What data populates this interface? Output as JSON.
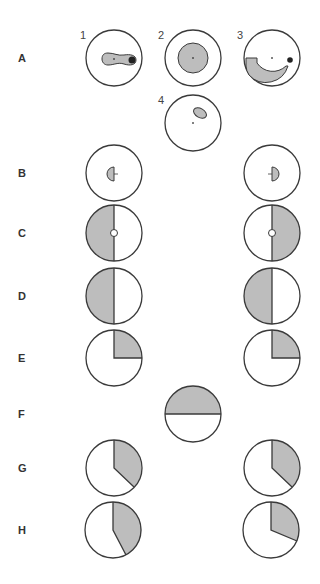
{
  "figure": {
    "row_labels": [
      {
        "id": "A",
        "text": "A",
        "y": 52
      },
      {
        "id": "B",
        "text": "B",
        "y": 167
      },
      {
        "id": "C",
        "text": "C",
        "y": 227
      },
      {
        "id": "D",
        "text": "D",
        "y": 290
      },
      {
        "id": "E",
        "text": "E",
        "y": 352
      },
      {
        "id": "F",
        "text": "F",
        "y": 408
      },
      {
        "id": "G",
        "text": "G",
        "y": 462
      },
      {
        "id": "H",
        "text": "H",
        "y": 524
      }
    ],
    "panel_numbers": [
      {
        "text": "1",
        "x": 80,
        "y": 29
      },
      {
        "text": "2",
        "x": 158,
        "y": 29
      },
      {
        "text": "3",
        "x": 237,
        "y": 29
      },
      {
        "text": "4",
        "x": 158,
        "y": 94
      }
    ],
    "colors": {
      "stroke": "#3a3a3a",
      "fill": "#bdbdbd",
      "dark": "#222222",
      "background": "#ffffff"
    }
  }
}
